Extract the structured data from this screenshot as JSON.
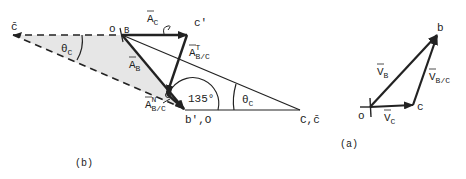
{
  "figure_b": {
    "caption": "(b)",
    "points": {
      "c_bar_left": "c̄",
      "o_B": {
        "o": "o",
        "B": "B"
      },
      "c_prime": "c'",
      "b_prime_O": "b',O",
      "C_cbar": "C,c̄"
    },
    "vectors": {
      "A_C": {
        "base": "A",
        "sub": "C"
      },
      "A_B": {
        "base": "A",
        "sub": "B"
      },
      "A_BC_T": {
        "base": "A",
        "sup": "T",
        "sub": "B/C"
      },
      "A_BC_N": {
        "base": "A",
        "sup": "N",
        "sub": "B/C"
      }
    },
    "angles": {
      "theta_C_left": {
        "base": "θ",
        "sub": "C"
      },
      "theta_C_right": {
        "base": "θ",
        "sub": "C"
      },
      "obtuse": "135°"
    }
  },
  "figure_a": {
    "caption": "(a)",
    "points": {
      "o": "o",
      "b": "b",
      "c": "c"
    },
    "vectors": {
      "V_B": {
        "base": "V",
        "sub": "B"
      },
      "V_C": {
        "base": "V",
        "sub": "C"
      },
      "V_BC": {
        "base": "V",
        "sub": "B/C"
      }
    }
  },
  "colors": {
    "ink": "#222222",
    "shade": "#e6e6e6",
    "background": "#ffffff"
  }
}
